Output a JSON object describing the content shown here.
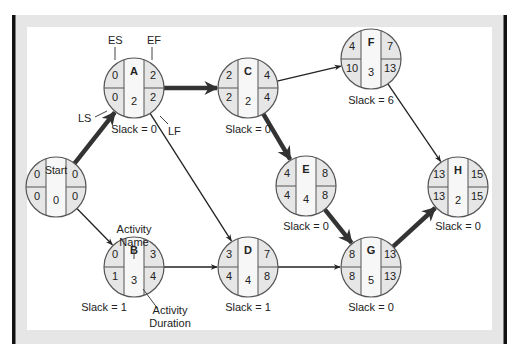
{
  "diagram": {
    "type": "activity-on-node network (critical path)",
    "colors": {
      "frame_border": "#111111",
      "frame_band": "#e6e6e6",
      "panel": "#ffffff",
      "node_fill_side": "#e8e8e8",
      "node_fill_center": "#f7f7f7",
      "node_stroke": "#555555",
      "arrow": "#222222",
      "critical_arrow": "#333333"
    },
    "nodes": [
      {
        "id": "start",
        "name": "Start",
        "es": "0",
        "ef": "0",
        "ls": "0",
        "lf": "0",
        "duration": "0",
        "slack": ""
      },
      {
        "id": "A",
        "name": "A",
        "es": "0",
        "ef": "2",
        "ls": "0",
        "lf": "2",
        "duration": "2",
        "slack": "Slack = 0"
      },
      {
        "id": "B",
        "name": "B",
        "es": "0",
        "ef": "3",
        "ls": "1",
        "lf": "4",
        "duration": "3",
        "slack": "Slack = 1"
      },
      {
        "id": "C",
        "name": "C",
        "es": "2",
        "ef": "4",
        "ls": "2",
        "lf": "4",
        "duration": "2",
        "slack": "Slack = 0"
      },
      {
        "id": "D",
        "name": "D",
        "es": "3",
        "ef": "7",
        "ls": "4",
        "lf": "8",
        "duration": "4",
        "slack": "Slack = 1"
      },
      {
        "id": "E",
        "name": "E",
        "es": "4",
        "ef": "8",
        "ls": "4",
        "lf": "8",
        "duration": "4",
        "slack": "Slack = 0"
      },
      {
        "id": "F",
        "name": "F",
        "es": "4",
        "ef": "7",
        "ls": "10",
        "lf": "13",
        "duration": "3",
        "slack": "Slack = 6"
      },
      {
        "id": "G",
        "name": "G",
        "es": "8",
        "ef": "13",
        "ls": "8",
        "lf": "13",
        "duration": "5",
        "slack": "Slack = 0"
      },
      {
        "id": "H",
        "name": "H",
        "es": "13",
        "ef": "15",
        "ls": "13",
        "lf": "15",
        "duration": "2",
        "slack": "Slack = 0"
      }
    ],
    "edges": [
      {
        "from": "start",
        "to": "A",
        "critical": true
      },
      {
        "from": "start",
        "to": "B",
        "critical": false
      },
      {
        "from": "A",
        "to": "C",
        "critical": true
      },
      {
        "from": "A",
        "to": "D",
        "critical": false
      },
      {
        "from": "B",
        "to": "D",
        "critical": false
      },
      {
        "from": "C",
        "to": "F",
        "critical": false
      },
      {
        "from": "C",
        "to": "E",
        "critical": true
      },
      {
        "from": "D",
        "to": "G",
        "critical": false
      },
      {
        "from": "E",
        "to": "G",
        "critical": true
      },
      {
        "from": "F",
        "to": "H",
        "critical": false
      },
      {
        "from": "G",
        "to": "H",
        "critical": true
      }
    ],
    "annotations": {
      "es": "ES",
      "ef": "EF",
      "ls": "LS",
      "lf": "LF",
      "activity_name_line1": "Activity",
      "activity_name_line2": "Name",
      "activity_duration_line1": "Activity",
      "activity_duration_line2": "Duration"
    }
  }
}
